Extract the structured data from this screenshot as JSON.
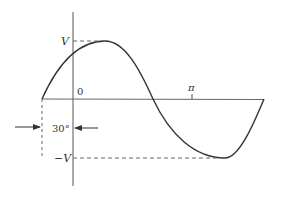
{
  "diagram": {
    "type": "sine-wave-phase-shift",
    "labels": {
      "peak": "V",
      "trough": "−V",
      "origin": "0",
      "pi": "π",
      "phase": "30°"
    },
    "colors": {
      "curve": "#333333",
      "axis": "#555555",
      "dashed": "#666666"
    }
  }
}
